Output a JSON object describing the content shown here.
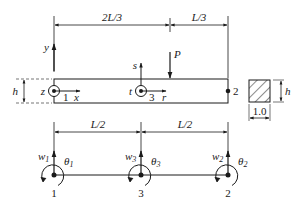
{
  "diagram": {
    "type": "beam finite element model",
    "top_view": {
      "dimensions": [
        {
          "label": "2L/3",
          "from": "left end",
          "to": "load P"
        },
        {
          "label": "L/3",
          "from": "load P",
          "to": "right end"
        }
      ],
      "load": {
        "label": "P",
        "direction": "down"
      },
      "height_label": "h",
      "global_axes": {
        "vertical": "y",
        "horizontal": "x",
        "out_of_plane": "z"
      },
      "local_axes": {
        "vertical": "s",
        "horizontal": "r",
        "out_of_plane": "t"
      },
      "nodes": [
        {
          "id": "1",
          "position": "left end"
        },
        {
          "id": "3",
          "position": "mid-span"
        },
        {
          "id": "2",
          "position": "right end"
        }
      ]
    },
    "cross_section": {
      "height_label": "h",
      "width_label": "1.0"
    },
    "bottom_view": {
      "dimensions": [
        {
          "label": "L/2"
        },
        {
          "label": "L/2"
        }
      ],
      "nodes": [
        {
          "id": "1",
          "w": "w",
          "w_sub": "1",
          "theta": "θ",
          "theta_sub": "1"
        },
        {
          "id": "3",
          "w": "w",
          "w_sub": "3",
          "theta": "θ",
          "theta_sub": "3"
        },
        {
          "id": "2",
          "w": "w",
          "w_sub": "2",
          "theta": "θ",
          "theta_sub": "2"
        }
      ]
    }
  }
}
